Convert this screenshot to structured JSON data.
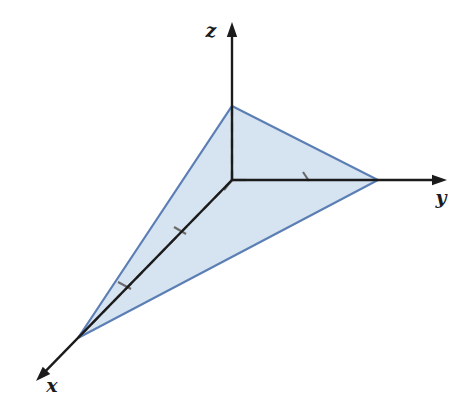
{
  "figure": {
    "background_color": "#ffffff",
    "width": 475,
    "height": 415
  },
  "axes": {
    "origin": {
      "x": 232,
      "y": 180
    },
    "color": "#1b1b1b",
    "stroke_width": 2.4,
    "items": [
      {
        "id": "x",
        "label": "x",
        "label_pos": {
          "x": 52,
          "y": 392
        },
        "line": {
          "x1": 232,
          "y1": 180,
          "x2": 36,
          "y2": 381
        },
        "arrow_tip": {
          "x": 36,
          "y": 381
        },
        "direction": "down-left"
      },
      {
        "id": "y",
        "label": "y",
        "label_pos": {
          "x": 441,
          "y": 204
        },
        "line": {
          "x1": 232,
          "y1": 180,
          "x2": 447,
          "y2": 180
        },
        "arrow_tip": {
          "x": 447,
          "y": 180
        },
        "direction": "right"
      },
      {
        "id": "z",
        "label": "z",
        "label_pos": {
          "x": 211,
          "y": 37
        },
        "line": {
          "x1": 232,
          "y1": 180,
          "x2": 232,
          "y2": 22
        },
        "arrow_tip": {
          "x": 232,
          "y": 22
        },
        "direction": "up"
      }
    ]
  },
  "triangle": {
    "fill_color": "#d6e3f0",
    "stroke_color": "#5b7fb5",
    "stroke_width": 2.2,
    "points": "232,106 378,180 78,338",
    "vertices": [
      {
        "id": "z-intercept",
        "axis": "z",
        "x": 232,
        "y": 106
      },
      {
        "id": "y-intercept",
        "axis": "y",
        "x": 378,
        "y": 180
      },
      {
        "id": "x-intercept",
        "axis": "x",
        "x": 78,
        "y": 338
      }
    ]
  },
  "dashed_lines": {
    "color": "#6b6b6b",
    "stroke_width": 2.2,
    "dash_pattern": "9 7",
    "segments": [
      {
        "id": "origin-to-z-intercept",
        "x1": 232,
        "y1": 180,
        "x2": 232,
        "y2": 106
      },
      {
        "id": "origin-to-y-intercept",
        "x1": 232,
        "y1": 180,
        "x2": 378,
        "y2": 180
      },
      {
        "id": "origin-to-x-intercept",
        "x1": 232,
        "y1": 180,
        "x2": 78,
        "y2": 338
      }
    ]
  },
  "tick_marks": {
    "color": "#6b6b6b",
    "stroke_width": 2.2,
    "items": [
      {
        "id": "tick-y-axis",
        "x1": 303,
        "y1": 172,
        "x2": 309,
        "y2": 181
      },
      {
        "id": "tick-x-axis-near",
        "x1": 174,
        "y1": 227,
        "x2": 186,
        "y2": 234
      },
      {
        "id": "tick-x-axis-far",
        "x1": 118,
        "y1": 282,
        "x2": 131,
        "y2": 289
      },
      {
        "id": "tick-origin-up",
        "x1": 232,
        "y1": 170,
        "x2": 232,
        "y2": 180
      },
      {
        "id": "tick-origin-right",
        "x1": 232,
        "y1": 180,
        "x2": 246,
        "y2": 180
      },
      {
        "id": "tick-origin-down",
        "x1": 232,
        "y1": 180,
        "x2": 224,
        "y2": 190
      }
    ]
  }
}
